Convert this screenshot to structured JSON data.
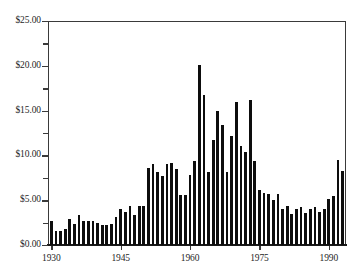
{
  "chart_data": {
    "type": "bar",
    "title": "",
    "subtitle": "",
    "xlabel": "",
    "ylabel": "",
    "xlim": [
      1929.5,
      1993.5
    ],
    "ylim": [
      0.0,
      25.0
    ],
    "grid": false,
    "legend": null,
    "bar_color": "#0d0d0d",
    "axis_color": "#3a3a3a",
    "background_color": "#ffffff",
    "y_tick_labels": [
      "$0.00",
      "$5.00",
      "$10.00",
      "$15.00",
      "$20.00",
      "$25.00"
    ],
    "y_tick_values": [
      0,
      5,
      10,
      15,
      20,
      25
    ],
    "y_minor_tick_values": [
      2.5,
      7.5,
      12.5,
      17.5,
      22.5
    ],
    "x_tick_labels": [
      "1930",
      "1945",
      "1960",
      "1975",
      "1990"
    ],
    "x_tick_values": [
      1930,
      1945,
      1960,
      1975,
      1990
    ],
    "categories": [
      1930,
      1931,
      1932,
      1933,
      1934,
      1935,
      1936,
      1937,
      1938,
      1939,
      1940,
      1941,
      1942,
      1943,
      1944,
      1945,
      1946,
      1947,
      1948,
      1949,
      1950,
      1951,
      1952,
      1953,
      1954,
      1955,
      1956,
      1957,
      1958,
      1959,
      1960,
      1961,
      1962,
      1963,
      1964,
      1965,
      1966,
      1967,
      1968,
      1969,
      1970,
      1971,
      1972,
      1973,
      1974,
      1975,
      1976,
      1977,
      1978,
      1979,
      1980,
      1981,
      1982,
      1983,
      1984,
      1985,
      1986,
      1987,
      1988,
      1989,
      1990,
      1991,
      1992,
      1993
    ],
    "values": [
      2.7,
      1.6,
      1.6,
      1.8,
      2.9,
      2.4,
      3.3,
      2.7,
      2.7,
      2.7,
      2.5,
      2.2,
      2.2,
      2.4,
      3.1,
      4.0,
      3.7,
      4.4,
      3.3,
      4.3,
      4.4,
      8.6,
      9.0,
      8.1,
      7.7,
      9.0,
      9.1,
      8.5,
      5.6,
      5.6,
      7.8,
      9.4,
      20.1,
      16.7,
      8.1,
      11.7,
      15.0,
      13.4,
      8.2,
      12.2,
      16.0,
      11.1,
      10.4,
      16.2,
      9.4,
      6.1,
      5.8,
      5.7,
      5.0,
      5.7,
      4.0,
      4.3,
      3.5,
      4.0,
      4.2,
      3.6,
      4.0,
      4.2,
      3.7,
      4.0,
      5.1,
      5.5,
      9.5,
      8.3
    ]
  }
}
